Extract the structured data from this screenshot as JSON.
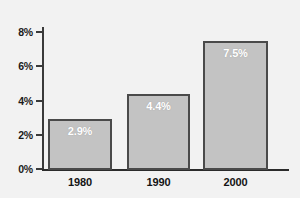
{
  "chart_data": {
    "type": "bar",
    "title": "",
    "subtitle": "",
    "xlabel": "",
    "ylabel": "",
    "categories": [
      "1980",
      "1990",
      "2000"
    ],
    "values": [
      2.9,
      4.4,
      7.5
    ],
    "value_labels": [
      "2.9%",
      "4.4%",
      "7.5%"
    ],
    "series": [
      {
        "name": "",
        "values": [
          2.9,
          4.4,
          7.5
        ]
      }
    ],
    "ylim": [
      0,
      8
    ],
    "ytick_values": [
      0,
      2,
      4,
      6,
      8
    ],
    "ytick_labels": [
      "0%",
      "2%",
      "4%",
      "6%",
      "8%"
    ],
    "grid": false,
    "legend": false,
    "legend_position": "none",
    "annotations": [],
    "colors": {
      "background": "#f2f2f2",
      "bar_fill": "#c3c3c3",
      "bar_border": "#4a4a4a",
      "axis": "#2b2b2b",
      "tick_label": "#1b1b1b",
      "value_label": "#ffffff",
      "category_label": "#141414"
    }
  }
}
